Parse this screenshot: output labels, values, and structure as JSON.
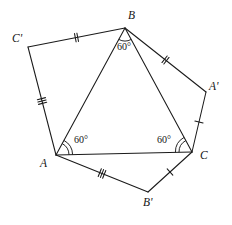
{
  "figure": {
    "name": "equilateral-triangle-with-external-triangles",
    "background_color": "#ffffff",
    "stroke_color": "#1a1a1a",
    "width": 232,
    "height": 225,
    "vertices": {
      "A": {
        "label": "A",
        "x": 56,
        "y": 155,
        "label_x": 40,
        "label_y": 167
      },
      "B": {
        "label": "B",
        "x": 125,
        "y": 28,
        "label_x": 128,
        "label_y": 19
      },
      "C": {
        "label": "C",
        "x": 192,
        "y": 152,
        "label_x": 200,
        "label_y": 159
      },
      "A_prime": {
        "label": "A'",
        "x": 206,
        "y": 92,
        "label_x": 209,
        "label_y": 90
      },
      "B_prime": {
        "label": "B'",
        "x": 148,
        "y": 192,
        "label_x": 143,
        "label_y": 206
      },
      "C_prime": {
        "label": "C'",
        "x": 28,
        "y": 47,
        "label_x": 12,
        "label_y": 42
      }
    },
    "edges": [
      {
        "name": "edge-A-B",
        "from": "A",
        "to": "B",
        "ticks": 0
      },
      {
        "name": "edge-B-C",
        "from": "B",
        "to": "C",
        "ticks": 0
      },
      {
        "name": "edge-A-C",
        "from": "A",
        "to": "C",
        "ticks": 0
      },
      {
        "name": "edge-C-prime-B",
        "from": "C_prime",
        "to": "B",
        "ticks": 2
      },
      {
        "name": "edge-C-prime-A",
        "from": "C_prime",
        "to": "A",
        "ticks": 3
      },
      {
        "name": "edge-B-A-prime",
        "from": "B",
        "to": "A_prime",
        "ticks": 2
      },
      {
        "name": "edge-A-prime-C",
        "from": "A_prime",
        "to": "C",
        "ticks": 1
      },
      {
        "name": "edge-A-B-prime",
        "from": "A",
        "to": "B_prime",
        "ticks": 3
      },
      {
        "name": "edge-B-prime-C",
        "from": "B_prime",
        "to": "C",
        "ticks": 1
      }
    ],
    "angles": [
      {
        "name": "angle-at-B",
        "vertex": "B",
        "value": "60°",
        "arcs": 1,
        "label_x": 117,
        "label_y": 50
      },
      {
        "name": "angle-at-A",
        "vertex": "A",
        "value": "60°",
        "arcs": 2,
        "label_x": 74,
        "label_y": 143
      },
      {
        "name": "angle-at-C",
        "vertex": "C",
        "value": "60°",
        "arcs": 2,
        "label_x": 157,
        "label_y": 143
      }
    ]
  }
}
